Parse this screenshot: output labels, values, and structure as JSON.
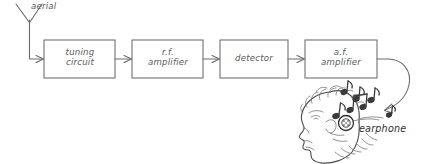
{
  "diagram": {
    "colors": {
      "stroke": "#6b6b6b",
      "box_stroke": "#787878",
      "text": "#5a5a5a",
      "note": "#3a3a3a",
      "background": "#ffffff"
    },
    "aerial": {
      "label": "aerial"
    },
    "blocks": [
      {
        "id": "tuning-circuit",
        "label": "tuning\ncircuit"
      },
      {
        "id": "rf-amplifier",
        "label": "r.f.\namplifier"
      },
      {
        "id": "detector",
        "label": "detector"
      },
      {
        "id": "af-amplifier",
        "label": "a.f.\namplifier"
      }
    ],
    "output": {
      "label": "earphone"
    },
    "icons": {
      "aerial": "antenna-icon",
      "arrow": "arrow-right-icon",
      "curved_arrow": "curved-arrow-icon",
      "listener": "head-profile-icon",
      "earphone": "earphone-disc-icon",
      "music": "music-notes-icon"
    }
  }
}
